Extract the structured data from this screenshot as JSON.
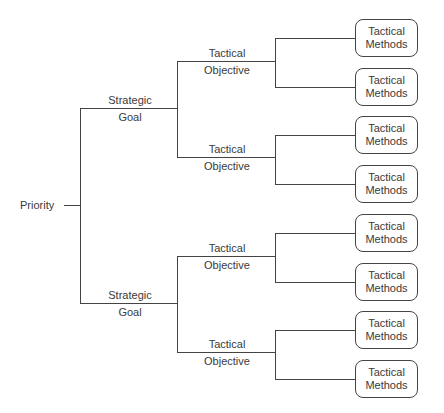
{
  "root": {
    "label": "Priority"
  },
  "strategic_goals": [
    {
      "line1": "Strategic",
      "line2": "Goal"
    },
    {
      "line1": "Strategic",
      "line2": "Goal"
    }
  ],
  "tactical_objectives": [
    {
      "line1": "Tactical",
      "line2": "Objective"
    },
    {
      "line1": "Tactical",
      "line2": "Objective"
    },
    {
      "line1": "Tactical",
      "line2": "Objective"
    },
    {
      "line1": "Tactical",
      "line2": "Objective"
    }
  ],
  "tactical_methods": [
    {
      "line1": "Tactical",
      "line2": "Methods"
    },
    {
      "line1": "Tactical",
      "line2": "Methods"
    },
    {
      "line1": "Tactical",
      "line2": "Methods"
    },
    {
      "line1": "Tactical",
      "line2": "Methods"
    },
    {
      "line1": "Tactical",
      "line2": "Methods"
    },
    {
      "line1": "Tactical",
      "line2": "Methods"
    },
    {
      "line1": "Tactical",
      "line2": "Methods"
    },
    {
      "line1": "Tactical",
      "line2": "Methods"
    }
  ]
}
